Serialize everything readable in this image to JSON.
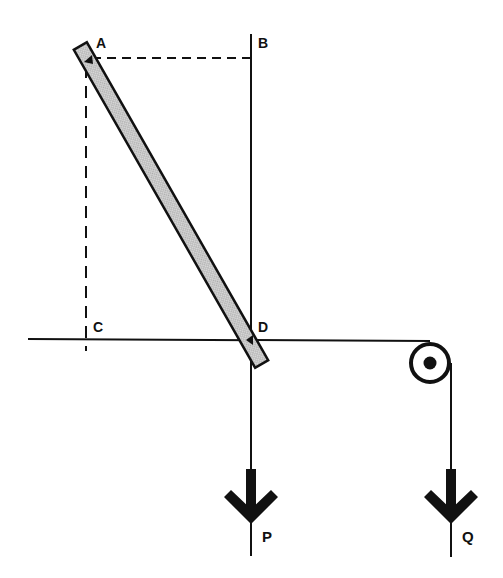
{
  "diagram": {
    "type": "mechanics-statics",
    "points": [
      {
        "id": "A",
        "label": "A",
        "x": 88,
        "y": 58
      },
      {
        "id": "B",
        "label": "B",
        "x": 251,
        "y": 58
      },
      {
        "id": "C",
        "label": "C",
        "x": 86,
        "y": 339
      },
      {
        "id": "D",
        "label": "D",
        "x": 251,
        "y": 339
      }
    ],
    "labels": {
      "A": "A",
      "B": "B",
      "C": "C",
      "D": "D",
      "P": "P",
      "Q": "Q"
    },
    "rod": {
      "description": "shaded rod from A to D, extending slightly beyond both ends"
    },
    "forces": [
      {
        "id": "P",
        "label": "P",
        "direction": "down",
        "at_x": 251
      },
      {
        "id": "Q",
        "label": "Q",
        "direction": "down",
        "at_x": 451
      }
    ],
    "pulley": {
      "cx": 430,
      "cy": 363
    },
    "colors": {
      "ink": "#111111",
      "rod_fill": "#bdbdbd",
      "background": "#ffffff"
    }
  }
}
